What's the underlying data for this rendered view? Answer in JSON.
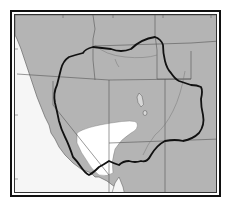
{
  "map": {
    "type": "range map",
    "region": "Western United States (Great Basin / Colorado Plateau)",
    "colors": {
      "land": "#b4b4b4",
      "ocean": "#f6f6f6",
      "range_outline": "#111111",
      "state_lines": "#555555",
      "rivers": "#777777",
      "excluded_area": "#ffffff",
      "frame": "#111111"
    },
    "graticule_labels": [
      {
        "text": "120°",
        "position": "top"
      },
      {
        "text": "115°",
        "position": "top"
      },
      {
        "text": "110°",
        "position": "top"
      },
      {
        "text": "105°",
        "position": "top"
      },
      {
        "text": "45°",
        "position": "left"
      },
      {
        "text": "40°",
        "position": "left"
      },
      {
        "text": "35°",
        "position": "left"
      },
      {
        "text": "45°",
        "position": "right"
      },
      {
        "text": "40°",
        "position": "right"
      },
      {
        "text": "35°",
        "position": "right"
      },
      {
        "text": "110°",
        "position": "bottom"
      }
    ],
    "features": {
      "range_boundary": "thick black outline enclosing range",
      "excluded_region": "white area (desert) within southwest of range",
      "lakes": "Great Salt Lake, Utah Lake"
    }
  }
}
